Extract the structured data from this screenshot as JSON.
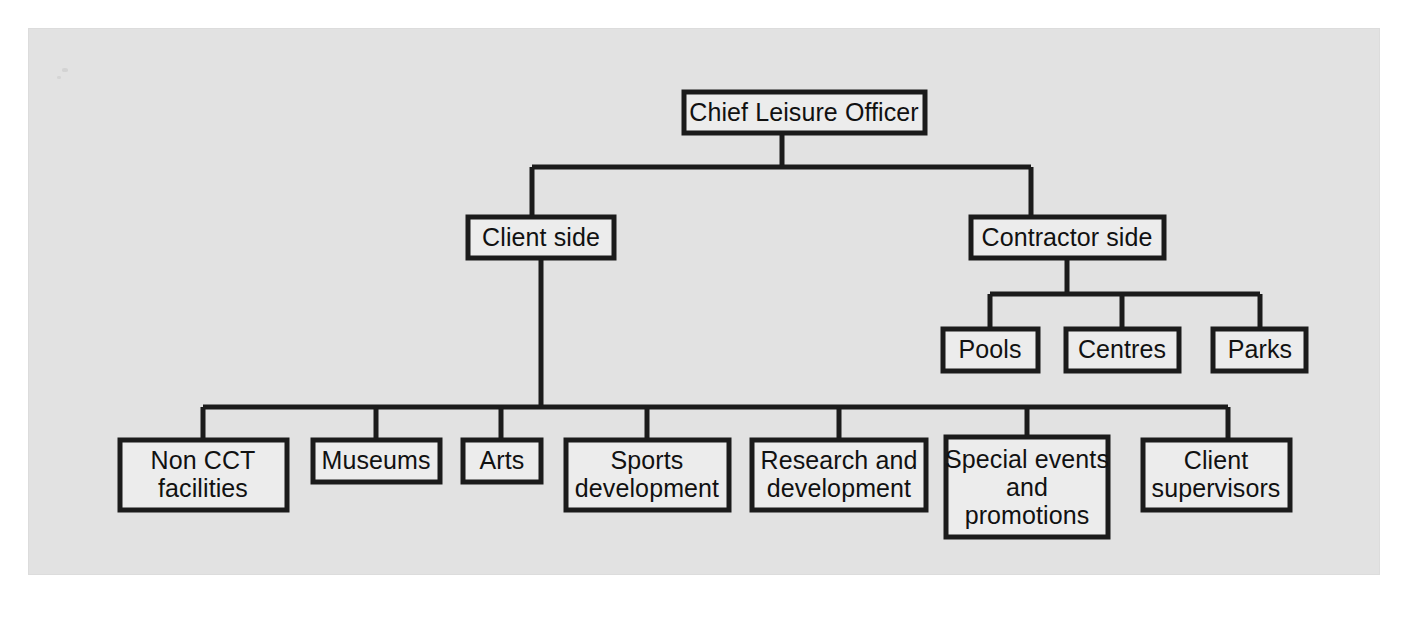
{
  "diagram": {
    "type": "organisation-chart",
    "panel": {
      "background_color": "#e2e2e2",
      "border_color": "#dcdcdc"
    },
    "style": {
      "box_fill": "#ececec",
      "box_stroke": "#1b1b1b",
      "line_color": "#1b1b1b",
      "text_color": "#111111"
    },
    "levels": [
      {
        "level": 1,
        "nodes": [
          {
            "id": "chief",
            "label": "Chief Leisure Officer",
            "lines": [
              "Chief Leisure Officer"
            ]
          }
        ]
      },
      {
        "level": 2,
        "nodes": [
          {
            "id": "client",
            "label": "Client side",
            "lines": [
              "Client side"
            ]
          },
          {
            "id": "contractor",
            "label": "Contractor side",
            "lines": [
              "Contractor side"
            ]
          }
        ]
      },
      {
        "level": 3,
        "parent": "contractor",
        "nodes": [
          {
            "id": "pools",
            "label": "Pools",
            "lines": [
              "Pools"
            ]
          },
          {
            "id": "centres",
            "label": "Centres",
            "lines": [
              "Centres"
            ]
          },
          {
            "id": "parks",
            "label": "Parks",
            "lines": [
              "Parks"
            ]
          }
        ]
      },
      {
        "level": 4,
        "parent": "client",
        "nodes": [
          {
            "id": "non-cct",
            "label": "Non CCT facilities",
            "lines": [
              "Non CCT",
              "facilities"
            ]
          },
          {
            "id": "museums",
            "label": "Museums",
            "lines": [
              "Museums"
            ]
          },
          {
            "id": "arts",
            "label": "Arts",
            "lines": [
              "Arts"
            ]
          },
          {
            "id": "sports-dev",
            "label": "Sports development",
            "lines": [
              "Sports",
              "development"
            ]
          },
          {
            "id": "research-dev",
            "label": "Research and development",
            "lines": [
              "Research and",
              "development"
            ]
          },
          {
            "id": "special-events",
            "label": "Special events and promotions",
            "lines": [
              "Special events",
              "and",
              "promotions"
            ]
          },
          {
            "id": "client-supervisors",
            "label": "Client supervisors",
            "lines": [
              "Client",
              "supervisors"
            ]
          }
        ]
      }
    ],
    "labels": {
      "chief": "Chief Leisure Officer",
      "client": "Client side",
      "contractor": "Contractor side",
      "pools": "Pools",
      "centres": "Centres",
      "parks": "Parks",
      "non_cct_1": "Non CCT",
      "non_cct_2": "facilities",
      "museums": "Museums",
      "arts": "Arts",
      "sports_1": "Sports",
      "sports_2": "development",
      "research_1": "Research and",
      "research_2": "development",
      "special_1": "Special events",
      "special_2": "and",
      "special_3": "promotions",
      "supervisors_1": "Client",
      "supervisors_2": "supervisors"
    }
  }
}
